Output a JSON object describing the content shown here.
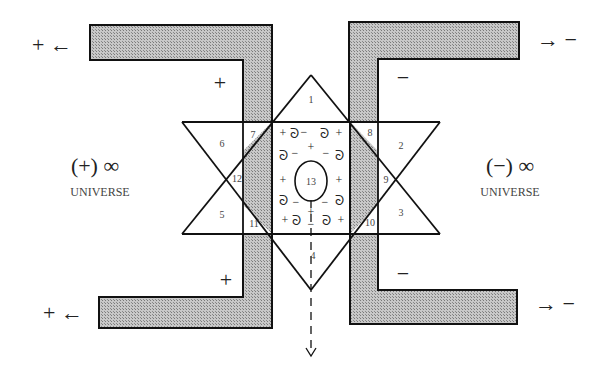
{
  "diagram": {
    "colors": {
      "stroke": "#111111",
      "hatch_fill": "#b8b8b8",
      "background": "#ffffff"
    },
    "left_universe": {
      "label": "UNIVERSE",
      "symbol": "(+) ∞",
      "polarity": "+"
    },
    "right_universe": {
      "label": "UNIVERSE",
      "symbol": "(−) ∞",
      "polarity": "−"
    },
    "outer_flows": {
      "top_left": "+ ←",
      "bottom_left": "+ ←",
      "top_right": "→ −",
      "bottom_right": "→ −"
    },
    "inner_signs": {
      "top_left": "+",
      "bottom_left": "+",
      "top_right": "−",
      "bottom_right": "−"
    },
    "regions": [
      "1",
      "2",
      "3",
      "4",
      "5",
      "6",
      "7",
      "8",
      "9",
      "10",
      "11",
      "12",
      "13"
    ],
    "center_symbols": {
      "plus": "+",
      "minus": "−",
      "coil": "ᘐ"
    }
  }
}
